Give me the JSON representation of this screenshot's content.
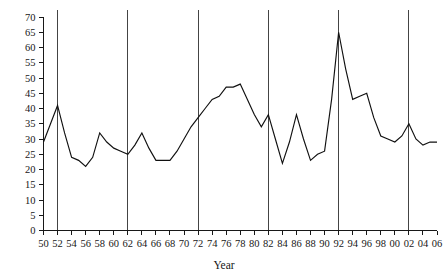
{
  "chart_data": {
    "type": "line",
    "title": "",
    "xlabel": "Year",
    "ylabel": "",
    "xlim": [
      1950,
      2006
    ],
    "ylim": [
      0,
      70
    ],
    "ytick_step": 5,
    "xtick_step": 2,
    "grid": false,
    "legend": null,
    "line_color": "#101010",
    "reference_line_color": "#303030",
    "reference_lines": [
      1952,
      1962,
      1972,
      1982,
      1992,
      2002
    ],
    "x": [
      1950,
      1951,
      1952,
      1953,
      1954,
      1955,
      1956,
      1957,
      1958,
      1959,
      1960,
      1961,
      1962,
      1963,
      1964,
      1965,
      1966,
      1967,
      1968,
      1969,
      1970,
      1971,
      1972,
      1973,
      1974,
      1975,
      1976,
      1977,
      1978,
      1979,
      1980,
      1981,
      1982,
      1983,
      1984,
      1985,
      1986,
      1987,
      1988,
      1989,
      1990,
      1991,
      1992,
      1993,
      1994,
      1995,
      1996,
      1997,
      1998,
      1999,
      2000,
      2001,
      2002,
      2003,
      2004,
      2005,
      2006
    ],
    "values": [
      29,
      35,
      41,
      32,
      24,
      23,
      21,
      24,
      32,
      29,
      27,
      26,
      25,
      28,
      32,
      27,
      23,
      23,
      23,
      26,
      30,
      34,
      37,
      40,
      43,
      44,
      47,
      47,
      48,
      43,
      38,
      34,
      38,
      30,
      22,
      29,
      38,
      30,
      23,
      25,
      26,
      43,
      65,
      53,
      43,
      44,
      45,
      37,
      31,
      30,
      29,
      31,
      35,
      30,
      28,
      29,
      29
    ],
    "ytick_labels": [
      "0",
      "5",
      "10",
      "15",
      "20",
      "25",
      "30",
      "35",
      "40",
      "45",
      "50",
      "55",
      "60",
      "65",
      "70"
    ],
    "xtick_labels": [
      "50",
      "52",
      "54",
      "56",
      "58",
      "60",
      "62",
      "64",
      "66",
      "68",
      "70",
      "72",
      "74",
      "76",
      "78",
      "80",
      "82",
      "84",
      "86",
      "88",
      "90",
      "92",
      "94",
      "96",
      "98",
      "00",
      "02",
      "04",
      "06"
    ],
    "xtick_values": [
      1950,
      1952,
      1954,
      1956,
      1958,
      1960,
      1962,
      1964,
      1966,
      1968,
      1970,
      1972,
      1974,
      1976,
      1978,
      1980,
      1982,
      1984,
      1986,
      1988,
      1990,
      1992,
      1994,
      1996,
      1998,
      2000,
      2002,
      2004,
      2006
    ]
  }
}
